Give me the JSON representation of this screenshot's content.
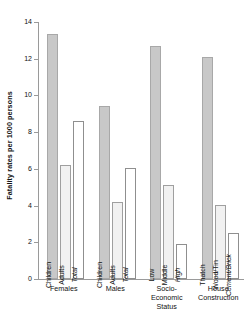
{
  "chart_data": {
    "type": "bar",
    "title": "",
    "xlabel": "",
    "ylabel": "Fatality rates per 1000 persons",
    "ylim": [
      0,
      14
    ],
    "ytick_labels": [
      "0",
      "2",
      "4",
      "6",
      "8",
      "10",
      "12",
      "14"
    ],
    "ytick_values": [
      0,
      2,
      4,
      6,
      8,
      10,
      12,
      14
    ],
    "grid": false,
    "legend": "none",
    "groups": [
      {
        "name": "Females",
        "label": "Females",
        "bars": [
          {
            "label": "Children",
            "value": 13.35,
            "style": "fill-dark",
            "italic": false
          },
          {
            "label": "Adults",
            "value": 6.2,
            "style": "fill-light",
            "italic": false
          },
          {
            "label": "Total",
            "value": 8.6,
            "style": "fill-white",
            "italic": true
          }
        ]
      },
      {
        "name": "Males",
        "label": "Males",
        "bars": [
          {
            "label": "Children",
            "value": 9.45,
            "style": "fill-dark",
            "italic": false
          },
          {
            "label": "Adults",
            "value": 4.2,
            "style": "fill-light",
            "italic": false
          },
          {
            "label": "Total",
            "value": 6.05,
            "style": "fill-white",
            "italic": true
          }
        ]
      },
      {
        "name": "Socio-Economic Status",
        "label": "Socio-\nEconomic\nStatus",
        "bars": [
          {
            "label": "Low",
            "value": 12.7,
            "style": "fill-dark",
            "italic": false
          },
          {
            "label": "Middle",
            "value": 5.1,
            "style": "fill-light",
            "italic": false
          },
          {
            "label": "High",
            "value": 1.9,
            "style": "fill-white",
            "italic": true
          }
        ]
      },
      {
        "name": "House Construction",
        "label": "House\nConstruction",
        "bars": [
          {
            "label": "Thatch",
            "value": 12.1,
            "style": "fill-dark",
            "italic": false
          },
          {
            "label": "Wood/Tin",
            "value": 4.05,
            "style": "fill-light",
            "italic": false
          },
          {
            "label": "Cement/Brick",
            "value": 2.5,
            "style": "fill-white",
            "italic": true
          }
        ]
      }
    ]
  }
}
